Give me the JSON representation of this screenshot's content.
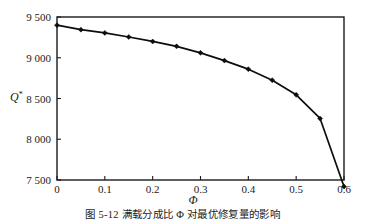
{
  "figure": {
    "caption": "图 5-12  满载分成比 Φ 对最优修复量的影响"
  },
  "axes": {
    "y_label": "Q",
    "y_label_sup": "*",
    "x_label": "Φ"
  },
  "chart_data": {
    "type": "line",
    "title": "",
    "xlabel": "Φ",
    "ylabel": "Q*",
    "xlim": [
      0,
      0.6
    ],
    "ylim": [
      7500,
      9500
    ],
    "xticks": [
      "0",
      "0.1",
      "0.2",
      "0.3",
      "0.4",
      "0.5",
      "0.6"
    ],
    "xtick_values": [
      0,
      0.1,
      0.2,
      0.3,
      0.4,
      0.5,
      0.6
    ],
    "yticks": [
      "9 500",
      "9 000",
      "8 500",
      "8 000",
      "7 500"
    ],
    "ytick_values": [
      9500,
      9000,
      8500,
      8000,
      7500
    ],
    "grid": false,
    "legend": null,
    "marker": "diamond",
    "series": [
      {
        "name": "Q*",
        "x": [
          0,
          0.05,
          0.1,
          0.15,
          0.2,
          0.25,
          0.3,
          0.35,
          0.4,
          0.45,
          0.5,
          0.55,
          0.6
        ],
        "values": [
          9400,
          9345,
          9305,
          9255,
          9200,
          9140,
          9060,
          8965,
          8860,
          8725,
          8545,
          8255,
          7420
        ]
      }
    ]
  }
}
